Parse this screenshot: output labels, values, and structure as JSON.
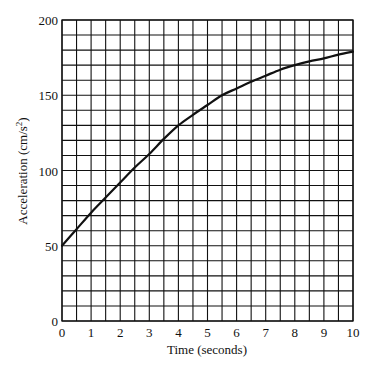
{
  "chart_data": {
    "type": "line",
    "title": "",
    "xlabel": "Time  (seconds)",
    "ylabel": "Acceleration  (cm/s",
    "ylabel_sup": "2",
    "ylabel_close": ")",
    "xlim": [
      0,
      10
    ],
    "ylim": [
      0,
      200
    ],
    "x_ticks": [
      0,
      1,
      2,
      3,
      4,
      5,
      6,
      7,
      8,
      9,
      10
    ],
    "y_ticks": [
      0,
      50,
      100,
      150,
      200
    ],
    "grid": {
      "on": true,
      "x_minor_step": 0.5,
      "y_minor_step": 10
    },
    "legend": null,
    "series": [
      {
        "name": "acceleration",
        "color": "#111111",
        "x": [
          0,
          0.5,
          1,
          1.5,
          2,
          2.5,
          3,
          3.5,
          4,
          4.5,
          5,
          5.5,
          6,
          6.5,
          7,
          7.5,
          8,
          8.5,
          9,
          9.5,
          10
        ],
        "y": [
          50,
          61,
          72,
          82,
          92,
          102,
          111,
          121,
          130,
          137,
          143.5,
          150,
          154.5,
          159,
          163,
          167,
          170,
          172.5,
          174.5,
          177,
          179
        ]
      }
    ]
  },
  "colors": {
    "background": "#ffffff",
    "grid": "#111111",
    "line": "#111111",
    "text": "#111111"
  }
}
